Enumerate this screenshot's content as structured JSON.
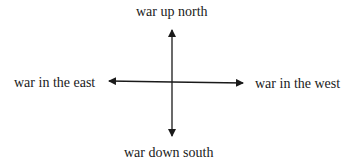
{
  "diagram": {
    "labels": {
      "north": "war up north",
      "south": "war down south",
      "east": "war in the east",
      "west": "war in the west"
    },
    "colors": {
      "stroke": "#1a1a1a",
      "background": "#ffffff"
    }
  }
}
